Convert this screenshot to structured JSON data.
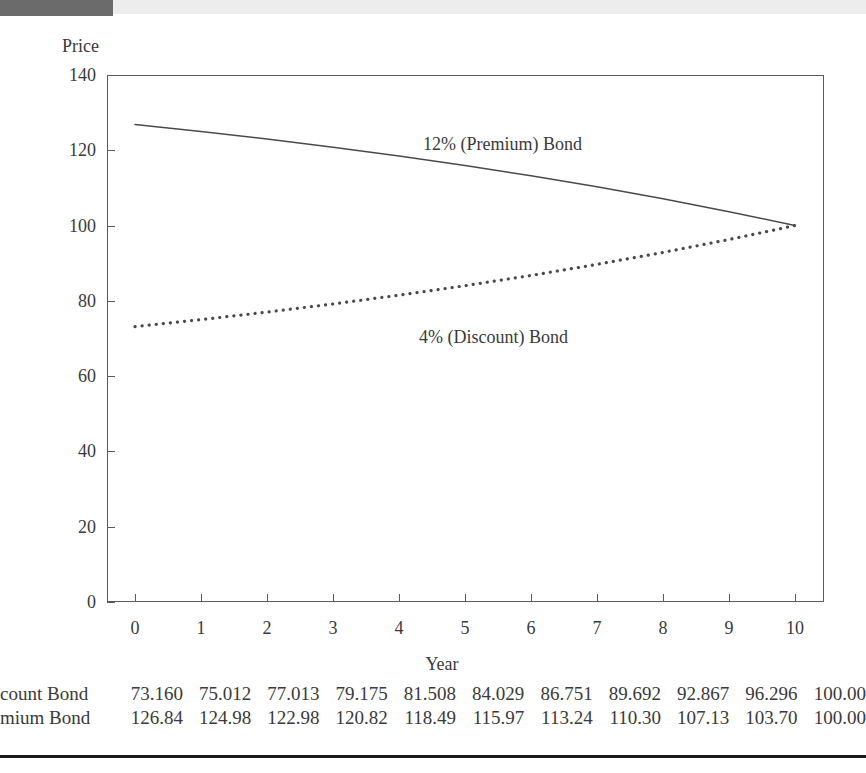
{
  "figure": {
    "y_axis_title": "Price",
    "x_axis_title": "Year"
  },
  "chart_data": {
    "type": "line",
    "title": "",
    "xlabel": "Year",
    "ylabel": "Price",
    "xlim": [
      0,
      10
    ],
    "ylim": [
      0,
      140
    ],
    "xticks": [
      "0",
      "1",
      "2",
      "3",
      "4",
      "5",
      "6",
      "7",
      "8",
      "9",
      "10"
    ],
    "yticks": [
      "0",
      "20",
      "40",
      "60",
      "80",
      "100",
      "120",
      "140"
    ],
    "grid": false,
    "legend_position": "in-plot annotations",
    "x": [
      0,
      1,
      2,
      3,
      4,
      5,
      6,
      7,
      8,
      9,
      10
    ],
    "series": [
      {
        "name": "12% (Premium) Bond",
        "style": "solid",
        "color": "#4a4a4a",
        "annotation": "12% (Premium) Bond",
        "values": [
          126.84,
          124.98,
          122.98,
          120.82,
          118.49,
          115.97,
          113.24,
          110.3,
          107.13,
          103.7,
          100.0
        ]
      },
      {
        "name": "4% (Discount) Bond",
        "style": "dotted",
        "color": "#4a4a4a",
        "annotation": "4% (Discount) Bond",
        "values": [
          73.16,
          75.012,
          77.013,
          79.175,
          81.508,
          84.029,
          86.751,
          89.692,
          92.867,
          96.296,
          100.0
        ]
      }
    ]
  },
  "table": {
    "rows": [
      {
        "label": "count Bond",
        "values": [
          "73.160",
          "75.012",
          "77.013",
          "79.175",
          "81.508",
          "84.029",
          "86.751",
          "89.692",
          "92.867",
          "96.296",
          "100.00"
        ]
      },
      {
        "label": "mium Bond",
        "values": [
          "126.84",
          "124.98",
          "122.98",
          "120.82",
          "118.49",
          "115.97",
          "113.24",
          "110.30",
          "107.13",
          "103.70",
          "100.00"
        ]
      }
    ]
  }
}
